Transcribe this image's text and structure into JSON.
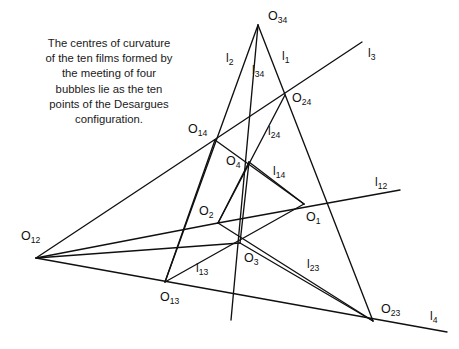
{
  "figure": {
    "width": 459,
    "height": 349,
    "background": "#ffffff",
    "ink_color": "#101010",
    "caption": "The centres of curvature\nof the ten films formed by\nthe meeting of four\nbubbles lie as the ten\npoints of the Desargues\nconfiguration."
  },
  "chart_data": {
    "type": "diagram",
    "points": [
      {
        "id": "O34",
        "base": "O",
        "sub": "34",
        "x": 258,
        "y": 25,
        "label_x": 268,
        "label_y": 20
      },
      {
        "id": "O24",
        "base": "O",
        "sub": "24",
        "x": 285,
        "y": 95,
        "label_x": 292,
        "label_y": 102
      },
      {
        "id": "O14",
        "base": "O",
        "sub": "14",
        "x": 215,
        "y": 140,
        "label_x": 188,
        "label_y": 133
      },
      {
        "id": "O4",
        "base": "O",
        "sub": "4",
        "x": 249,
        "y": 162,
        "label_x": 226,
        "label_y": 165
      },
      {
        "id": "O2",
        "base": "O",
        "sub": "2",
        "x": 218,
        "y": 223,
        "label_x": 199,
        "label_y": 215
      },
      {
        "id": "O1",
        "base": "O",
        "sub": "1",
        "x": 304,
        "y": 204,
        "label_x": 306,
        "label_y": 221
      },
      {
        "id": "O3",
        "base": "O",
        "sub": "3",
        "x": 240,
        "y": 243,
        "label_x": 244,
        "label_y": 262
      },
      {
        "id": "O12",
        "base": "O",
        "sub": "12",
        "x": 36,
        "y": 258,
        "label_x": 21,
        "label_y": 240
      },
      {
        "id": "O13",
        "base": "O",
        "sub": "13",
        "x": 165,
        "y": 282,
        "label_x": 160,
        "label_y": 301
      },
      {
        "id": "O23",
        "base": "O",
        "sub": "23",
        "x": 373,
        "y": 321,
        "label_x": 381,
        "label_y": 313
      }
    ],
    "lines": [
      {
        "id": "l1",
        "base": "l",
        "sub": "1",
        "x1": 258,
        "y1": 25,
        "x2": 373,
        "y2": 321,
        "label_x": 282,
        "label_y": 60
      },
      {
        "id": "l2",
        "base": "l",
        "sub": "2",
        "x1": 258,
        "y1": 25,
        "x2": 165,
        "y2": 282,
        "label_x": 226,
        "label_y": 62
      },
      {
        "id": "l34",
        "base": "l",
        "sub": "34",
        "x1": 258,
        "y1": 25,
        "x2": 231,
        "y2": 320,
        "label_x": 252,
        "label_y": 74
      },
      {
        "id": "l3",
        "base": "l",
        "sub": "3",
        "x1": 36,
        "y1": 258,
        "x2": 362,
        "y2": 42,
        "label_x": 368,
        "label_y": 57
      },
      {
        "id": "l12",
        "base": "l",
        "sub": "12",
        "x1": 218,
        "y1": 223,
        "x2": 400,
        "y2": 190,
        "label_x": 375,
        "label_y": 186
      },
      {
        "id": "l4",
        "base": "l",
        "sub": "4",
        "x1": 36,
        "y1": 258,
        "x2": 447,
        "y2": 332,
        "label_x": 430,
        "label_y": 320
      },
      {
        "id": "l24",
        "base": "l",
        "sub": "24",
        "x1": 285,
        "y1": 95,
        "x2": 218,
        "y2": 223,
        "label_x": 268,
        "label_y": 135
      },
      {
        "id": "l14",
        "base": "l",
        "sub": "14",
        "x1": 249,
        "y1": 162,
        "x2": 304,
        "y2": 204,
        "label_x": 273,
        "label_y": 175
      },
      {
        "id": "l13",
        "base": "l",
        "sub": "13",
        "x1": 165,
        "y1": 282,
        "x2": 304,
        "y2": 204,
        "label_x": 196,
        "label_y": 272
      },
      {
        "id": "l23",
        "base": "l",
        "sub": "23",
        "x1": 240,
        "y1": 243,
        "x2": 373,
        "y2": 321,
        "label_x": 307,
        "label_y": 268
      }
    ],
    "segments": [
      {
        "name": "l3-ray",
        "x1": 36,
        "y1": 258,
        "x2": 362,
        "y2": 42
      },
      {
        "name": "l4-ray",
        "x1": 36,
        "y1": 258,
        "x2": 447,
        "y2": 332
      },
      {
        "name": "O12-O14",
        "x1": 36,
        "y1": 258,
        "x2": 240,
        "y2": 243
      },
      {
        "name": "l1-long",
        "x1": 258,
        "y1": 25,
        "x2": 373,
        "y2": 321
      },
      {
        "name": "l2-long",
        "x1": 258,
        "y1": 25,
        "x2": 165,
        "y2": 282
      },
      {
        "name": "l34-long",
        "x1": 258,
        "y1": 25,
        "x2": 231,
        "y2": 320
      },
      {
        "name": "l12-seg",
        "x1": 218,
        "y1": 223,
        "x2": 400,
        "y2": 190
      },
      {
        "name": "l24-seg",
        "x1": 285,
        "y1": 95,
        "x2": 218,
        "y2": 223
      },
      {
        "name": "l14-seg",
        "x1": 249,
        "y1": 162,
        "x2": 304,
        "y2": 204
      },
      {
        "name": "l13-seg",
        "x1": 165,
        "y1": 282,
        "x2": 304,
        "y2": 204
      },
      {
        "name": "l23-seg",
        "x1": 240,
        "y1": 243,
        "x2": 373,
        "y2": 321
      },
      {
        "name": "O14-O4-O1",
        "x1": 215,
        "y1": 140,
        "x2": 304,
        "y2": 204
      },
      {
        "name": "O14-O2-O13",
        "x1": 215,
        "y1": 140,
        "x2": 165,
        "y2": 282
      },
      {
        "name": "O4-O3",
        "x1": 249,
        "y1": 162,
        "x2": 240,
        "y2": 243
      },
      {
        "name": "O4-O2",
        "x1": 249,
        "y1": 162,
        "x2": 218,
        "y2": 223
      },
      {
        "name": "O2-O3-extend",
        "x1": 218,
        "y1": 223,
        "x2": 373,
        "y2": 321
      },
      {
        "name": "O12-l12-left",
        "x1": 36,
        "y1": 258,
        "x2": 218,
        "y2": 223
      }
    ]
  }
}
